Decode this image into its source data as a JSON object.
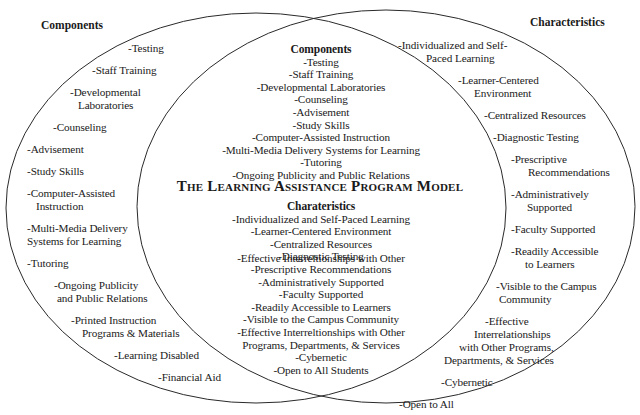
{
  "diagram": {
    "type": "venn",
    "title": "The Learning Assistance Program Model",
    "colors": {
      "stroke": "#2a2a2a",
      "text": "#1a1a1a",
      "background": "#ffffff"
    },
    "left_set": {
      "heading": "Components",
      "items": [
        "-Testing",
        "-Staff Training",
        "-Developmental",
        "Laboratories",
        "-Counseling",
        "-Advisement",
        "-Study Skills",
        "-Computer-Assisted",
        "Instruction",
        "-Multi-Media Delivery",
        "Systems for Learning",
        "-Tutoring",
        "-Ongoing Publicity",
        "and Public Relations",
        "-Printed Instruction",
        "Programs & Materials",
        "-Learning Disabled",
        "-Financial Aid"
      ]
    },
    "right_set": {
      "heading": "Characteristics",
      "items": [
        "-Individualized and Self-",
        "Paced Learning",
        "-Learner-Centered",
        "Environment",
        "-Centralized Resources",
        "-Diagnostic Testing",
        "-Prescriptive",
        "Recommendations",
        "-Administratively",
        "Supported",
        "-Faculty Supported",
        "-Readily Accessible",
        "to Learners",
        "-Visible to the Campus",
        "Community",
        "-Effective",
        "Interrelationships",
        "with Other Programs,",
        "Departments, & Services",
        "-Cybernetic",
        "-Open to All",
        "Students"
      ]
    },
    "intersection": {
      "components_heading": "Components",
      "components": [
        "-Testing",
        "-Staff Training",
        "-Developmental Laboratories",
        "-Counseling",
        "-Advisement",
        "-Study Skills",
        "-Computer-Assisted Instruction",
        "-Multi-Media Delivery Systems for Learning",
        "-Tutoring",
        "-Ongoing Publicity and Public Relations"
      ],
      "characteristics_heading": "Charateristics",
      "characteristics": [
        "-Individualized and Self-Paced Learning",
        "-Learner-Centered Environment",
        "-Centralized Resources",
        "-Diagnostic Testing",
        "-Prescriptive Recommendations",
        "-Administratively Supported",
        "-Faculty Supported",
        "-Readily Accessible to Learners",
        "-Visible to the Campus Community",
        "-Effective Interreltionships with Other",
        "Programs, Departments, & Services",
        "-Cybernetic",
        "-Open to All Students"
      ]
    }
  }
}
